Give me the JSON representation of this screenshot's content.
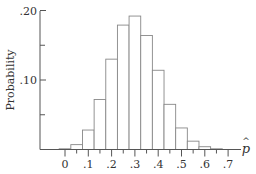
{
  "chart_data": {
    "type": "bar",
    "title": "",
    "xlabel": "p̂",
    "ylabel": "Probability",
    "x": [
      0.0,
      0.05,
      0.1,
      0.15,
      0.2,
      0.25,
      0.3,
      0.35,
      0.4,
      0.45,
      0.5,
      0.55,
      0.6,
      0.65
    ],
    "values": [
      0.001,
      0.007,
      0.028,
      0.072,
      0.13,
      0.179,
      0.192,
      0.164,
      0.114,
      0.065,
      0.031,
      0.012,
      0.004,
      0.001
    ],
    "bar_width": 0.05,
    "xlim": [
      -0.1,
      0.75
    ],
    "ylim": [
      0,
      0.2
    ],
    "x_ticks": [
      {
        "value": 0,
        "label": "0"
      },
      {
        "value": 0.1,
        "label": ".1"
      },
      {
        "value": 0.2,
        "label": ".2"
      },
      {
        "value": 0.3,
        "label": ".3"
      },
      {
        "value": 0.4,
        "label": ".4"
      },
      {
        "value": 0.5,
        "label": ".5"
      },
      {
        "value": 0.6,
        "label": ".6"
      },
      {
        "value": 0.7,
        "label": ".7"
      }
    ],
    "x_minor_ticks": [
      0.05,
      0.15,
      0.25,
      0.35,
      0.45,
      0.55,
      0.65
    ],
    "y_ticks": [
      {
        "value": 0.1,
        "label": ".10"
      },
      {
        "value": 0.2,
        "label": ".20"
      }
    ],
    "y_minor_ticks": [
      0.05,
      0.15
    ],
    "grid": false,
    "legend": null,
    "colors": {
      "axis": "#555555",
      "bar_stroke": "#888888",
      "bar_fill": "#ffffff",
      "text": "#333333"
    }
  }
}
